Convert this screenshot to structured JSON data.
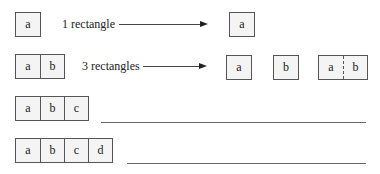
{
  "rows": [
    {
      "left_cells": [
        "a"
      ],
      "label": "1 rectangle",
      "result_boxes": [
        {
          "cells": [
            "a"
          ],
          "split": "none"
        }
      ]
    },
    {
      "left_cells": [
        "a",
        "b"
      ],
      "label": "3 rectangles",
      "result_boxes": [
        {
          "cells": [
            "a"
          ],
          "split": "none"
        },
        {
          "cells": [
            "b"
          ],
          "split": "none"
        },
        {
          "cells": [
            "a",
            "b"
          ],
          "split": "dashed"
        }
      ]
    },
    {
      "left_cells": [
        "a",
        "b",
        "c"
      ],
      "label": "",
      "blank_line": true
    },
    {
      "left_cells": [
        "a",
        "b",
        "c",
        "d"
      ],
      "label": "",
      "blank_line": true
    }
  ],
  "colors": {
    "border": "#555555",
    "fill": "#f4f4f4",
    "line": "#666666",
    "text": "#222222"
  }
}
